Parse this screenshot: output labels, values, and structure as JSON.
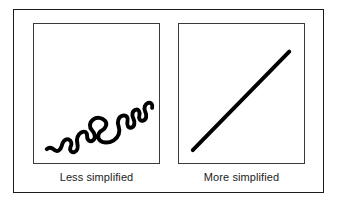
{
  "figure": {
    "background_color": "#ffffff",
    "frame_color": "#1b1b1b",
    "panel_border_color": "#3a3a3a",
    "stroke_color": "#000000"
  },
  "panels": [
    {
      "id": "less-simplified",
      "caption": "Less simplified",
      "shape_name": "sinuous-winding-line",
      "stroke_width": 4,
      "description": "A highly detailed winding squiggly line running from lower-left to upper-right",
      "path": "M 13 127 C 16 124 19 126 21 128 C 24 130 27 128 28 124 C 29 119 32 116 35 117 C 38 118 39 122 37 125 C 36 128 38 131 41 130 C 44 129 45 125 44 121 C 43 116 45 112 48 110 C 52 108 54 110 54 114 C 54 118 57 120 60 118 C 63 116 62 111 59 108 C 56 105 56 100 60 97 C 64 94 69 95 72 98 C 75 101 73 106 69 108 C 65 110 64 115 67 118 C 70 121 76 121 81 118 C 86 115 88 109 86 104 C 84 99 86 94 90 93 C 94 92 96 95 95 99 C 94 103 96 106 99 105 C 102 104 103 100 101 96 C 99 92 100 88 103 87 C 106 86 108 89 107 93 C 106 96 108 99 111 98 C 114 97 115 93 113 89 C 111 85 113 81 116 80 C 119 79 121 82 120 85"
    },
    {
      "id": "more-simplified",
      "caption": "More simplified",
      "shape_name": "straight-diagonal-line",
      "stroke_width": 4,
      "description": "A single straight diagonal line running from lower-left to upper-right",
      "line": {
        "x1": 14,
        "y1": 128,
        "x2": 112,
        "y2": 28
      }
    }
  ]
}
